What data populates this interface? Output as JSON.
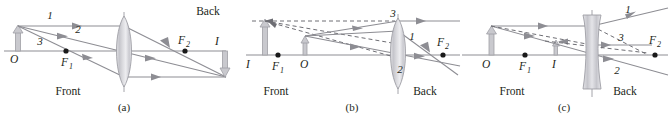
{
  "figure": {
    "type": "optics-ray-diagram",
    "panels": [
      {
        "id": "a",
        "caption": "(a)",
        "lens_type": "converging",
        "front_label": "Front",
        "back_label": "Back",
        "object_label": "O",
        "image_label": "I",
        "focal_near_label": "F",
        "focal_near_sub": "1",
        "focal_far_label": "F",
        "focal_far_sub": "2",
        "ray_labels": [
          "1",
          "2",
          "3"
        ],
        "description": "Converging lens, object outside focal point, real inverted image"
      },
      {
        "id": "b",
        "caption": "(b)",
        "lens_type": "converging",
        "front_label": "Front",
        "back_label": "Back",
        "object_label": "O",
        "image_label": "I",
        "focal_near_label": "F",
        "focal_near_sub": "1",
        "focal_far_label": "F",
        "focal_far_sub": "2",
        "ray_labels": [
          "1",
          "2",
          "3"
        ],
        "description": "Converging lens, object inside focal point, virtual upright magnified image"
      },
      {
        "id": "c",
        "caption": "(c)",
        "lens_type": "diverging",
        "front_label": "Front",
        "back_label": "Back",
        "object_label": "O",
        "image_label": "I",
        "focal_near_label": "F",
        "focal_near_sub": "1",
        "focal_far_label": "F",
        "focal_far_sub": "2",
        "ray_labels": [
          "1",
          "2",
          "3"
        ],
        "description": "Diverging lens, virtual upright reduced image"
      }
    ],
    "colors": {
      "ray": "#8d8d93",
      "dashed": "#6e6e74",
      "object": "#c9c9ce",
      "text": "#231f20",
      "background": "#ffffff"
    }
  }
}
